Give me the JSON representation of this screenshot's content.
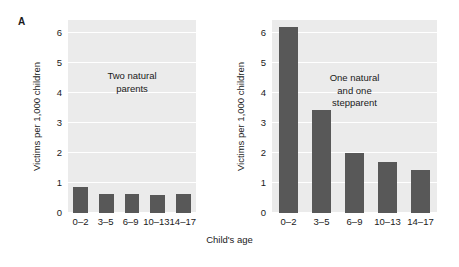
{
  "figure": {
    "panel_letter": "A",
    "xlabel": "Child's age",
    "ylabel": "Victims per 1,000 children",
    "bar_color": "#585858",
    "plot_background": "#ebebeb",
    "gridline_color": "#ffffff"
  },
  "yticks": [
    "0",
    "1",
    "2",
    "3",
    "4",
    "5",
    "6"
  ],
  "xticks": [
    "0–2",
    "3–5",
    "6–9",
    "10–13",
    "14–17"
  ],
  "panels": {
    "left": {
      "annotation_line1": "Two natural",
      "annotation_line2": "parents",
      "annotation_line3": ""
    },
    "right": {
      "annotation_line1": "One natural",
      "annotation_line2": "and one",
      "annotation_line3": "stepparent"
    }
  },
  "chart_data": [
    {
      "type": "bar",
      "panel": "A-left",
      "title": "Two natural parents",
      "categories": [
        "0–2",
        "3–5",
        "6–9",
        "10–13",
        "14–17"
      ],
      "values": [
        0.88,
        0.65,
        0.64,
        0.6,
        0.64
      ],
      "xlabel": "Child's age",
      "ylabel": "Victims per 1,000 children",
      "ylim": [
        0,
        6.45
      ],
      "yticks": [
        0,
        1,
        2,
        3,
        4,
        5,
        6
      ],
      "grid": true,
      "legend": "none",
      "bar_color": "#585858"
    },
    {
      "type": "bar",
      "panel": "A-right",
      "title": "One natural and one stepparent",
      "categories": [
        "0–2",
        "3–5",
        "6–9",
        "10–13",
        "14–17"
      ],
      "values": [
        6.2,
        3.45,
        2.0,
        1.7,
        1.45
      ],
      "xlabel": "Child's age",
      "ylabel": "Victims per 1,000 children",
      "ylim": [
        0,
        6.45
      ],
      "yticks": [
        0,
        1,
        2,
        3,
        4,
        5,
        6
      ],
      "grid": true,
      "legend": "none",
      "bar_color": "#585858"
    }
  ]
}
